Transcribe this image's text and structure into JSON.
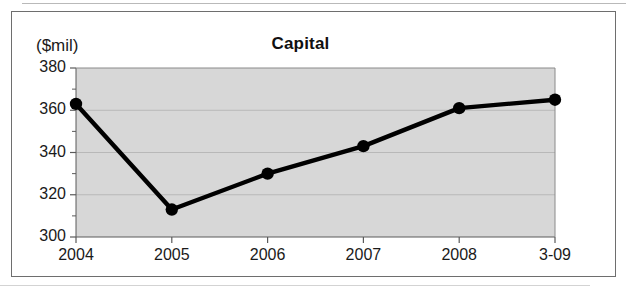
{
  "figure": {
    "unit_label": "($mil)",
    "title": "Capital"
  },
  "chart_data": {
    "type": "line",
    "title": "Capital",
    "subtitle": "",
    "xlabel": "",
    "ylabel": "($mil)",
    "unit": "$mil",
    "categories": [
      "2004",
      "2005",
      "2006",
      "2007",
      "2008",
      "3-09"
    ],
    "values": [
      363,
      313,
      330,
      343,
      361,
      365
    ],
    "series": [
      {
        "name": "Capital",
        "values": [
          363,
          313,
          330,
          343,
          361,
          365
        ]
      }
    ],
    "ylim": [
      300,
      380
    ],
    "yticks": [
      300,
      320,
      340,
      360,
      380
    ],
    "ytick_labels": [
      "300",
      "320",
      "340",
      "360",
      "380"
    ],
    "yminor_ticks": [
      310,
      330,
      350,
      370
    ],
    "xtick_labels": [
      "2004",
      "2005",
      "2006",
      "2007",
      "2008",
      "3-09"
    ],
    "grid": "horizontal",
    "legend": "none",
    "plot_background": "#d7d7d7",
    "line_color": "#000000",
    "marker": "circle",
    "marker_color": "#000000"
  },
  "colors": {
    "frame_border": "#6e6e6e",
    "plot_fill": "#d7d7d7",
    "gridline": "#b0b0b0",
    "axis": "#5a5a5a",
    "text": "#1a1a1a",
    "series_line": "#000000"
  }
}
